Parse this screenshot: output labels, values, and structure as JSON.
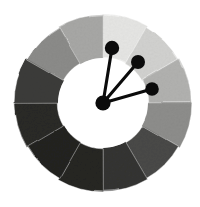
{
  "figure": {
    "background_color": "#ffffff"
  },
  "wheel": {
    "center_x": 103,
    "center_y": 103,
    "outer_radius": 88,
    "inner_radius": 45,
    "segment_count": 12,
    "segment_degrees": 30,
    "start_angle_deg": -90,
    "inner_disc_color": "#ffffff",
    "segment_border_color": "#ffffff"
  },
  "chart_data": {
    "type": "pie",
    "xlabel": "",
    "ylabel": "",
    "categories": [
      "12-1 o'clock",
      "1-2 o'clock",
      "2-3 o'clock",
      "3-4 o'clock",
      "4-5 o'clock",
      "5-6 o'clock",
      "6-7 o'clock",
      "7-8 o'clock",
      "8-9 o'clock",
      "9-10 o'clock",
      "10-11 o'clock",
      "11-12 o'clock"
    ],
    "values": [
      30,
      30,
      30,
      30,
      30,
      30,
      30,
      30,
      30,
      30,
      30,
      30
    ],
    "colors": [
      "#e6e6e4",
      "#d2d2d0",
      "#b2b2b0",
      "#8e8e8c",
      "#4a4a48",
      "#343432",
      "#262624",
      "#222220",
      "#2a2a28",
      "#3c3c3a",
      "#8c8c8a",
      "#a8a8a6"
    ],
    "value_labels": [
      "90%",
      "82%",
      "70%",
      "56%",
      "29%",
      "20%",
      "15%",
      "13%",
      "16%",
      "24%",
      "55%",
      "66%"
    ],
    "legend_position": "none",
    "grid": false
  },
  "pointers": [
    {
      "name": "pointer-upper",
      "x1": 103,
      "y1": 103,
      "x2": 112,
      "y2": 48,
      "dot_radius": 7.2,
      "angle_deg": -80,
      "color": "#0b0b0b"
    },
    {
      "name": "pointer-middle",
      "x1": 103,
      "y1": 103,
      "x2": 138,
      "y2": 62,
      "dot_radius": 7.0,
      "angle_deg": -49,
      "color": "#0b0b0b"
    },
    {
      "name": "pointer-lower",
      "x1": 103,
      "y1": 103,
      "x2": 152,
      "y2": 89,
      "dot_radius": 6.8,
      "angle_deg": -16,
      "color": "#0b0b0b"
    }
  ],
  "hub": {
    "x": 103,
    "y": 103,
    "radius": 7.6,
    "color": "#0b0b0b"
  }
}
